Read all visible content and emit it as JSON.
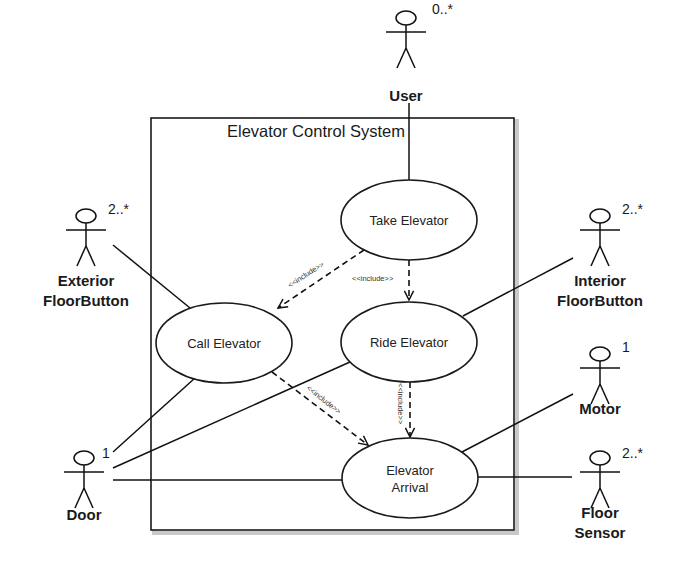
{
  "diagram": {
    "type": "UML use case diagram",
    "system": {
      "title": "Elevator Control System",
      "box": {
        "x": 151,
        "y": 118,
        "w": 363,
        "h": 412
      }
    },
    "use_cases": [
      {
        "id": "take",
        "label": "Take Elevator",
        "lines": [
          "Take Elevator"
        ],
        "cx": 409,
        "cy": 220,
        "rx": 68,
        "ry": 40
      },
      {
        "id": "call",
        "label": "Call Elevator",
        "lines": [
          "Call Elevator"
        ],
        "cx": 224,
        "cy": 343,
        "rx": 68,
        "ry": 40
      },
      {
        "id": "ride",
        "label": "Ride Elevator",
        "lines": [
          "Ride Elevator"
        ],
        "cx": 409,
        "cy": 342,
        "rx": 68,
        "ry": 40
      },
      {
        "id": "arrival",
        "label": "Elevator Arrival",
        "lines": [
          "Elevator",
          "Arrival"
        ],
        "cx": 410,
        "cy": 478,
        "rx": 68,
        "ry": 40
      }
    ],
    "actors": [
      {
        "id": "user",
        "lines": [
          "User"
        ],
        "multiplicity": "0..*",
        "x": 406,
        "y": 10,
        "label_y": 101,
        "mult_dx": 26,
        "mult_dy": 4
      },
      {
        "id": "exterior",
        "lines": [
          "Exterior",
          "FloorButton"
        ],
        "multiplicity": "2..*",
        "x": 86,
        "y": 208,
        "label_y": 286,
        "mult_dx": 22,
        "mult_dy": 6
      },
      {
        "id": "interior",
        "lines": [
          "Interior",
          "FloorButton"
        ],
        "multiplicity": "2..*",
        "x": 600,
        "y": 208,
        "label_y": 286,
        "mult_dx": 22,
        "mult_dy": 6
      },
      {
        "id": "motor",
        "lines": [
          "Motor"
        ],
        "multiplicity": "1",
        "x": 600,
        "y": 346,
        "label_y": 414,
        "mult_dx": 22,
        "mult_dy": 6
      },
      {
        "id": "floor-sensor",
        "lines": [
          "Floor",
          "Sensor"
        ],
        "multiplicity": "2..*",
        "x": 600,
        "y": 450,
        "label_y": 518,
        "mult_dx": 22,
        "mult_dy": 8
      },
      {
        "id": "door",
        "lines": [
          "Door"
        ],
        "multiplicity": "1",
        "x": 84,
        "y": 450,
        "label_y": 520,
        "mult_dx": 18,
        "mult_dy": 8
      }
    ],
    "associations": [
      {
        "from": "user",
        "to": "take",
        "x1": 409,
        "y1": 103,
        "x2": 409,
        "y2": 180
      },
      {
        "from": "exterior",
        "to": "call",
        "x1": 113,
        "y1": 245,
        "x2": 190,
        "y2": 308
      },
      {
        "from": "interior",
        "to": "ride",
        "x1": 573,
        "y1": 258,
        "x2": 463,
        "y2": 316
      },
      {
        "from": "motor",
        "to": "arrival",
        "x1": 573,
        "y1": 394,
        "x2": 462,
        "y2": 452
      },
      {
        "from": "floor-sensor",
        "to": "arrival",
        "x1": 572,
        "y1": 477,
        "x2": 478,
        "y2": 477
      },
      {
        "from": "door",
        "to": "call",
        "x1": 113,
        "y1": 452,
        "x2": 195,
        "y2": 378
      },
      {
        "from": "door",
        "to": "ride",
        "x1": 113,
        "y1": 468,
        "x2": 350,
        "y2": 362
      },
      {
        "from": "door",
        "to": "arrival",
        "x1": 113,
        "y1": 480,
        "x2": 342,
        "y2": 480
      }
    ],
    "includes": [
      {
        "from": "take",
        "to": "call",
        "label": "<<include>>",
        "x1": 364,
        "y1": 250,
        "x2": 278,
        "y2": 308,
        "lx": 290,
        "ly": 288,
        "angle": -33
      },
      {
        "from": "take",
        "to": "ride",
        "label": "<<include>>",
        "x1": 409,
        "y1": 260,
        "x2": 409,
        "y2": 300,
        "lx": 352,
        "ly": 281,
        "angle": 0
      },
      {
        "from": "call",
        "to": "arrival",
        "label": "<<include>>",
        "x1": 272,
        "y1": 372,
        "x2": 368,
        "y2": 445,
        "lx": 306,
        "ly": 389,
        "angle": 38
      },
      {
        "from": "ride",
        "to": "arrival",
        "label": "<<include>>",
        "x1": 410,
        "y1": 382,
        "x2": 410,
        "y2": 437,
        "lx": 398,
        "ly": 383,
        "angle": 90
      }
    ]
  }
}
